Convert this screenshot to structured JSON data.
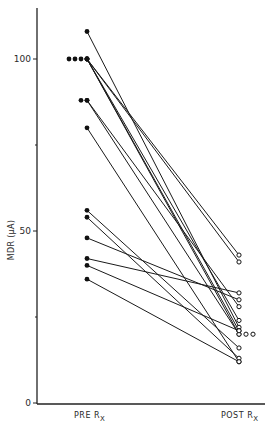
{
  "chart_data": {
    "type": "line",
    "title": "",
    "xlabel": "",
    "ylabel": "MDR (μA)",
    "ylim": [
      0,
      115
    ],
    "yticks": [
      0,
      50,
      100
    ],
    "ytick_labels": [
      "0",
      "50",
      "100"
    ],
    "categories": [
      {
        "main": "PRE R",
        "sub": "X"
      },
      {
        "main": "POST R",
        "sub": "X"
      }
    ],
    "grid": false,
    "legend": "none",
    "pre_marker": "filled-circle",
    "post_marker": "open-circle",
    "pairs": [
      {
        "pre": 108,
        "post": 22
      },
      {
        "pre": 100,
        "post": 43
      },
      {
        "pre": 100,
        "post": 41
      },
      {
        "pre": 100,
        "post": 24
      },
      {
        "pre": 100,
        "post": 21
      },
      {
        "pre": 100,
        "post": 20
      },
      {
        "pre": 88,
        "post": 28
      },
      {
        "pre": 88,
        "post": 20
      },
      {
        "pre": 80,
        "post": 12
      },
      {
        "pre": 56,
        "post": 16
      },
      {
        "pre": 54,
        "post": 13
      },
      {
        "pre": 48,
        "post": 30
      },
      {
        "pre": 42,
        "post": 32
      },
      {
        "pre": 40,
        "post": 21
      },
      {
        "pre": 36,
        "post": 12
      }
    ],
    "extra_pre_points": [
      100,
      100,
      100,
      88
    ],
    "extra_post_points": [
      20,
      20
    ]
  }
}
